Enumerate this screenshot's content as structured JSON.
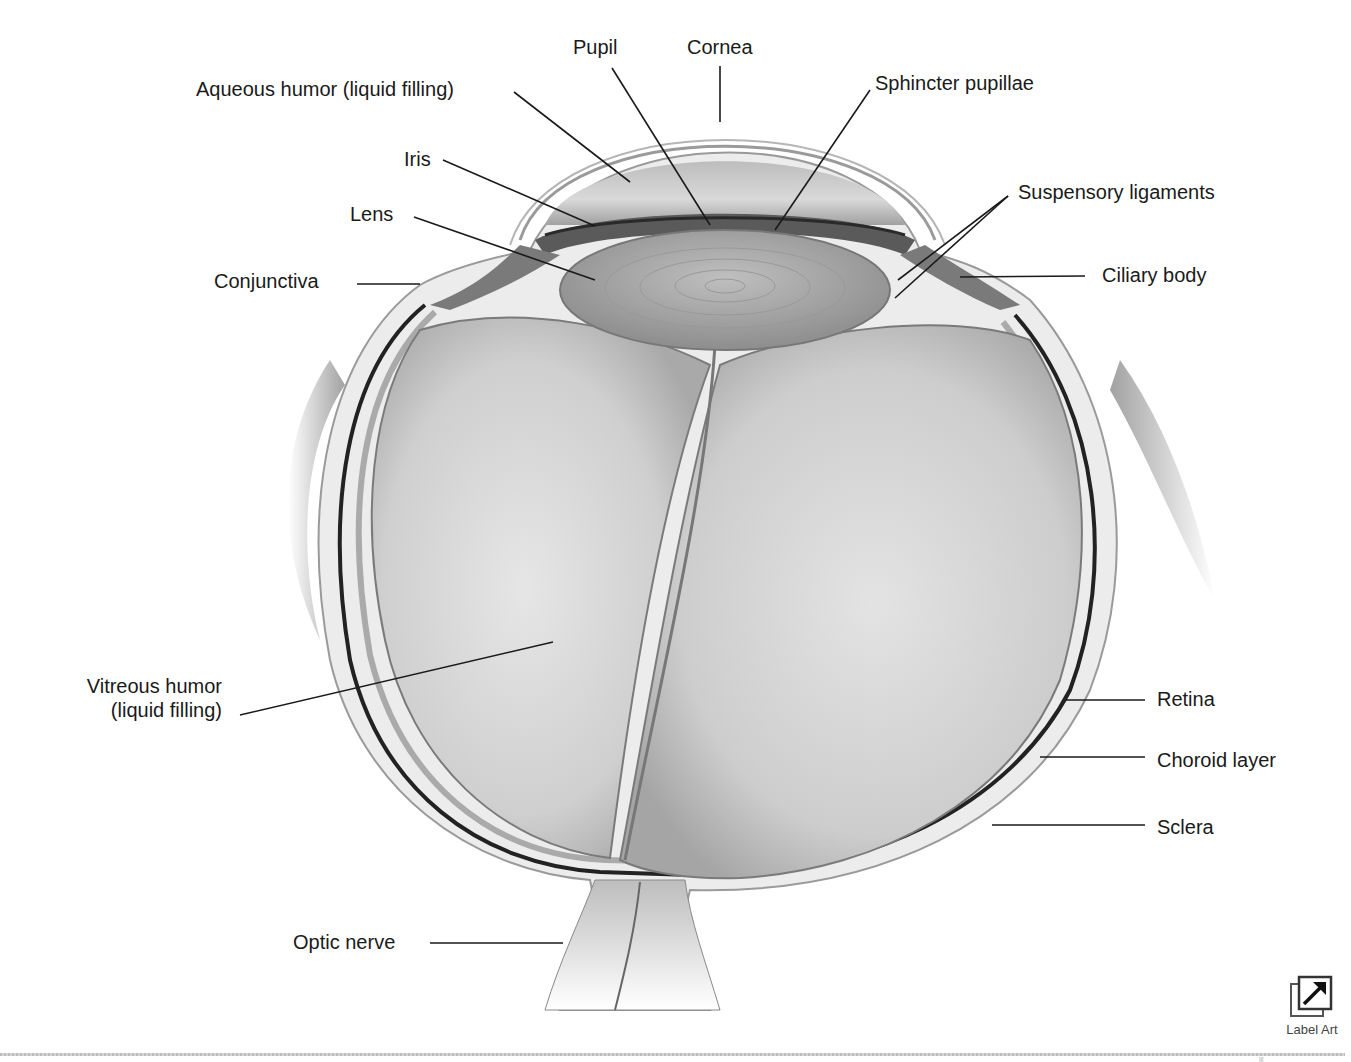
{
  "figure": {
    "labels": {
      "pupil": "Pupil",
      "cornea": "Cornea",
      "aqueous_humor": "Aqueous humor (liquid filling)",
      "sphincter_pupillae": "Sphincter pupillae",
      "iris": "Iris",
      "lens": "Lens",
      "suspensory_ligaments": "Suspensory ligaments",
      "conjunctiva": "Conjunctiva",
      "ciliary_body": "Ciliary body",
      "vitreous_humor_line1": "Vitreous humor",
      "vitreous_humor_line2": "(liquid filling)",
      "retina": "Retina",
      "choroid_layer": "Choroid layer",
      "sclera": "Sclera",
      "optic_nerve": "Optic nerve"
    }
  },
  "controls": {
    "label_art": {
      "caption": "Label Art",
      "icon": "external-link-arrow-icon"
    }
  },
  "footer": {
    "page_mark": "|||"
  }
}
